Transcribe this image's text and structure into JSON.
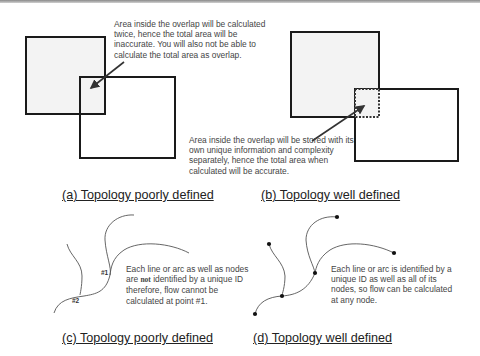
{
  "panels": {
    "a": {
      "caption": "(a) Topology poorly defined",
      "note": "Area inside the overlap will be calculated\ntwice, hence the total area will be\ninaccurate. You will also not be able to\ncalculate the total area as overlap."
    },
    "b": {
      "caption": "(b) Topology well defined",
      "note": "Area inside the overlap will be stored with its\nown unique information and complexity\nseparately, hence the total area when\ncalculated will be accurate."
    },
    "c": {
      "caption": "(c) Topology poorly defined",
      "note_pre": "Each line or arc as well as nodes\nare ",
      "note_not": "not",
      "note_post": " identified by a unique ID\ntherefore,  flow cannot be\ncalculated at point  #1.",
      "label_1": "#1",
      "label_2": "#2"
    },
    "d": {
      "caption": "(d) Topology well defined",
      "note": "Each line or arc is identified by a\nunique ID as well as all of its\nnodes, so flow can be calculated\nat any node."
    }
  },
  "colors": {
    "stroke": "#1a1a1a",
    "fill_shaded": "#f3f3f3",
    "arrow": "#333333",
    "curve": "#555555"
  }
}
